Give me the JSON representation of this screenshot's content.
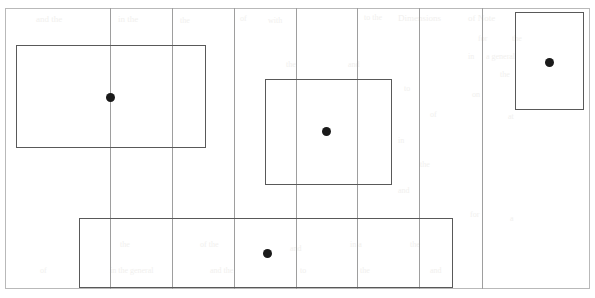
{
  "page": {
    "width": 595,
    "height": 298,
    "background_color": "#ffffff"
  },
  "frame": {
    "label": "page-border",
    "x": 5,
    "y": 8,
    "width": 585,
    "height": 281,
    "color": "#b9b9b9"
  },
  "gridlines": {
    "label": "column-guides",
    "color": "#9e9e9e",
    "orientation": "vertical",
    "positions": [
      110,
      172,
      234,
      296,
      357,
      419,
      482
    ]
  },
  "regions": {
    "border_color": "#595959",
    "centroid_color": "#1a1a1a",
    "items": [
      {
        "name": "region-left",
        "label": "Region 1",
        "x": 16,
        "y": 45,
        "width": 190,
        "height": 103,
        "centroid_x": 110,
        "centroid_y": 97
      },
      {
        "name": "region-center",
        "label": "Region 2",
        "x": 265,
        "y": 79,
        "width": 127,
        "height": 106,
        "centroid_x": 326,
        "centroid_y": 131
      },
      {
        "name": "region-bottom",
        "label": "Region 3",
        "x": 79,
        "y": 218,
        "width": 374,
        "height": 70,
        "centroid_x": 267,
        "centroid_y": 253
      },
      {
        "name": "region-right",
        "label": "Region 4",
        "x": 515,
        "y": 12,
        "width": 69,
        "height": 98,
        "centroid_x": 549,
        "centroid_y": 62
      }
    ]
  },
  "watermarks": [
    {
      "text": "and the",
      "x": 36,
      "y": 14,
      "size": 9
    },
    {
      "text": "in the",
      "x": 118,
      "y": 14,
      "size": 9
    },
    {
      "text": "the",
      "x": 180,
      "y": 16,
      "size": 8
    },
    {
      "text": "of",
      "x": 240,
      "y": 14,
      "size": 8
    },
    {
      "text": "with",
      "x": 268,
      "y": 16,
      "size": 8
    },
    {
      "text": "to the",
      "x": 364,
      "y": 13,
      "size": 8
    },
    {
      "text": "Dimensions",
      "x": 398,
      "y": 13,
      "size": 9
    },
    {
      "text": "of Note",
      "x": 468,
      "y": 13,
      "size": 9
    },
    {
      "text": "for",
      "x": 478,
      "y": 34,
      "size": 8
    },
    {
      "text": "the",
      "x": 512,
      "y": 34,
      "size": 8
    },
    {
      "text": "in",
      "x": 468,
      "y": 52,
      "size": 8
    },
    {
      "text": "a general",
      "x": 486,
      "y": 52,
      "size": 8
    },
    {
      "text": "the",
      "x": 500,
      "y": 70,
      "size": 8
    },
    {
      "text": "on",
      "x": 472,
      "y": 90,
      "size": 8
    },
    {
      "text": "at",
      "x": 508,
      "y": 112,
      "size": 8
    },
    {
      "text": "the",
      "x": 286,
      "y": 60,
      "size": 8
    },
    {
      "text": "and",
      "x": 348,
      "y": 60,
      "size": 8
    },
    {
      "text": "to",
      "x": 404,
      "y": 84,
      "size": 8
    },
    {
      "text": "of",
      "x": 430,
      "y": 110,
      "size": 8
    },
    {
      "text": "in",
      "x": 398,
      "y": 136,
      "size": 8
    },
    {
      "text": "the",
      "x": 420,
      "y": 160,
      "size": 8
    },
    {
      "text": "and",
      "x": 398,
      "y": 186,
      "size": 8
    },
    {
      "text": "for",
      "x": 470,
      "y": 210,
      "size": 8
    },
    {
      "text": "a",
      "x": 510,
      "y": 214,
      "size": 8
    },
    {
      "text": "the",
      "x": 120,
      "y": 240,
      "size": 8
    },
    {
      "text": "of the",
      "x": 200,
      "y": 240,
      "size": 8
    },
    {
      "text": "and",
      "x": 290,
      "y": 244,
      "size": 8
    },
    {
      "text": "in a",
      "x": 350,
      "y": 240,
      "size": 8
    },
    {
      "text": "the",
      "x": 410,
      "y": 240,
      "size": 8
    },
    {
      "text": "of",
      "x": 40,
      "y": 266,
      "size": 8
    },
    {
      "text": "in the general",
      "x": 110,
      "y": 266,
      "size": 8
    },
    {
      "text": "and the",
      "x": 210,
      "y": 266,
      "size": 8
    },
    {
      "text": "to",
      "x": 300,
      "y": 266,
      "size": 8
    },
    {
      "text": "the",
      "x": 360,
      "y": 266,
      "size": 8
    },
    {
      "text": "and",
      "x": 430,
      "y": 266,
      "size": 8
    }
  ]
}
